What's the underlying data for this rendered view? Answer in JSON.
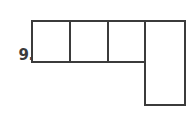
{
  "page": {
    "background_color": "#ffffff",
    "stroke_color": "#3b3b3b",
    "fill_color": "#ffffff"
  },
  "problem": {
    "number_label": "9.",
    "label_color": "#3b3b3b"
  },
  "figure": {
    "name": "composite-L-shaped-figure",
    "stroke_width": 2,
    "unit_square_count_in_row": 3,
    "tall_column_height_in_units": 2,
    "total_unit_squares": 5,
    "top_row": {
      "left_x": 32,
      "top_y": 21,
      "right_x": 145,
      "bottom_y": 62,
      "cell_divider_x_positions": [
        70,
        108
      ]
    },
    "tall_column": {
      "left_x": 145,
      "top_y": 21,
      "right_x": 185,
      "bottom_y": 105
    },
    "outline_points": "32,21 185,21 185,105 145,105 145,62 32,62",
    "internal_divider_lines": [
      {
        "name": "divider-1",
        "x1": 70,
        "y1": 21,
        "x2": 70,
        "y2": 62
      },
      {
        "name": "divider-2",
        "x1": 108,
        "y1": 21,
        "x2": 108,
        "y2": 62
      },
      {
        "name": "divider-3",
        "x1": 145,
        "y1": 21,
        "x2": 145,
        "y2": 62
      }
    ]
  }
}
